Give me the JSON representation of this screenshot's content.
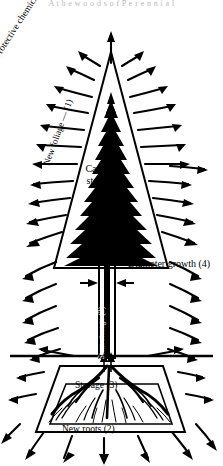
{
  "figure": {
    "title_strip": "A t h e  w o o d s  o f  P e r e n n i a l",
    "background_color": "#ffffff",
    "ink_color": "#000000",
    "labels": {
      "protective_chemicals": "Protective chemicals (5)",
      "new_foliage": "New foliage — (1)",
      "buds": "Buds (1)",
      "canopy_storage_line1": "Canopy",
      "canopy_storage_line2": "storage",
      "canopy_storage_line3": "(3)",
      "diameter_growth": "Diameter growth (4)",
      "stem_storage": "Stem storage (3)",
      "storage": "Storage (3)",
      "new_roots": "New roots (2)"
    },
    "priorities": {
      "buds_and_new_foliage": "1",
      "new_roots": "2",
      "storage": "3",
      "diameter_growth": "4",
      "protective_chemicals": "5"
    },
    "parts": {
      "crown": "triangular-conifer-crown",
      "stem": "vertical-stem",
      "root_zone": "inverted-trapezoid-root-zone",
      "ground_line": "horizontal-ground-line",
      "radiating_arrows": "wavy-outward-arrows",
      "upward_arrow": "canopy-upward-flow-arrow",
      "downward_arrow": "canopy-storage-downward-arrow",
      "diameter_arrows": "inward-pointing-diameter-arrows"
    }
  }
}
